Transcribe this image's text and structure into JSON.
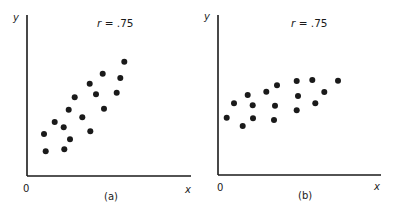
{
  "chart_data": [
    {
      "type": "scatter",
      "panel_label": "(a)",
      "annotation": "r = .75",
      "annotation_r": "r",
      "annotation_value": " = .75",
      "xlabel": "x",
      "ylabel": "y",
      "origin_label": "0",
      "grid": false,
      "xlim": [
        0,
        164
      ],
      "ylim": [
        0,
        161
      ],
      "axis_origin_px": [
        27,
        176
      ],
      "points": [
        [
          97.3,
          114.3
        ],
        [
          75.7,
          102.3
        ],
        [
          93.3,
          98.0
        ],
        [
          62.7,
          92.3
        ],
        [
          69.0,
          81.7
        ],
        [
          89.7,
          83.3
        ],
        [
          47.7,
          78.7
        ],
        [
          41.7,
          66.3
        ],
        [
          77.0,
          67.3
        ],
        [
          55.3,
          58.7
        ],
        [
          27.7,
          54.0
        ],
        [
          36.7,
          48.7
        ],
        [
          17.0,
          42.0
        ],
        [
          63.3,
          44.7
        ],
        [
          43.0,
          36.7
        ],
        [
          18.7,
          24.7
        ],
        [
          37.3,
          26.7
        ]
      ]
    },
    {
      "type": "scatter",
      "panel_label": "(b)",
      "annotation": "r = .75",
      "annotation_r": "r",
      "annotation_value": " = .75",
      "xlabel": "x",
      "ylabel": "y",
      "origin_label": "0",
      "grid": false,
      "xlim": [
        0,
        163
      ],
      "ylim": [
        0,
        160
      ],
      "axis_origin_px": [
        218,
        175
      ],
      "points": [
        [
          8.7,
          57.3
        ],
        [
          16.0,
          71.7
        ],
        [
          24.7,
          49.0
        ],
        [
          29.7,
          80.0
        ],
        [
          34.7,
          69.7
        ],
        [
          35.0,
          56.7
        ],
        [
          48.3,
          83.3
        ],
        [
          59.0,
          89.7
        ],
        [
          57.0,
          69.3
        ],
        [
          56.0,
          55.0
        ],
        [
          78.7,
          94.0
        ],
        [
          80.0,
          79.0
        ],
        [
          78.7,
          64.7
        ],
        [
          94.3,
          95.0
        ],
        [
          97.3,
          71.7
        ],
        [
          106.3,
          83.0
        ],
        [
          120.0,
          94.3
        ]
      ]
    }
  ],
  "colors": {
    "ink": "#1a1a1a",
    "background": "#ffffff"
  }
}
